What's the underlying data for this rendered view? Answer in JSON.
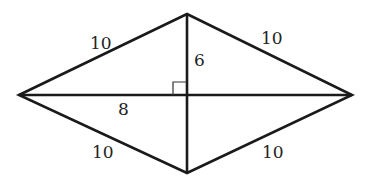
{
  "diagram": {
    "type": "rhombus-with-diagonals",
    "vertices": {
      "left": {
        "x": 19,
        "y": 95
      },
      "top": {
        "x": 187,
        "y": 14
      },
      "right": {
        "x": 352,
        "y": 95
      },
      "bottom": {
        "x": 187,
        "y": 173
      }
    },
    "labels": {
      "side_top_left": "10",
      "side_top_right": "10",
      "side_bottom_left": "10",
      "side_bottom_right": "10",
      "half_vertical_diagonal": "6",
      "half_horizontal_diagonal": "8"
    },
    "right_angle_marker": true,
    "stroke_color": "#1a1a1a",
    "background": "#ffffff"
  }
}
